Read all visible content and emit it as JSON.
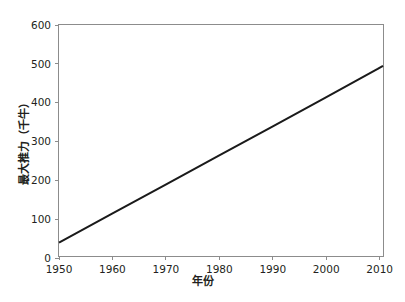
{
  "chart_data": {
    "type": "line",
    "title": "",
    "subtitle": "",
    "xlabel": "年份",
    "ylabel": "最大推力（千牛）",
    "xlim": [
      1950,
      2011
    ],
    "ylim": [
      0,
      600
    ],
    "xticks": [
      1950,
      1960,
      1970,
      1980,
      1990,
      2000,
      2010
    ],
    "xticklabels": [
      "1950",
      "1960",
      "1970",
      "1980",
      "1990",
      "2000",
      "2010"
    ],
    "yticks": [
      0,
      100,
      200,
      300,
      400,
      500,
      600
    ],
    "yticklabels": [
      "0",
      "100",
      "200",
      "300",
      "400",
      "500",
      "600"
    ],
    "grid": false,
    "legend": false,
    "legend_position": "none",
    "annotations": [],
    "series": [
      {
        "name": "最大推力",
        "color": "#1a1a1a",
        "linewidth": 2,
        "x": [
          1950,
          1960,
          1970,
          1980,
          1990,
          2000,
          2010,
          2011
        ],
        "values": [
          35,
          110,
          185,
          260,
          335,
          410,
          486,
          494
        ]
      }
    ]
  },
  "axes": {
    "y_tick_labels": [
      "600",
      "500",
      "400",
      "300",
      "200",
      "100",
      "0"
    ],
    "x_tick_labels": [
      "1950",
      "1960",
      "1970",
      "1980",
      "1990",
      "2000",
      "2010"
    ],
    "x_axis_title": "年份",
    "y_axis_title": "最大推力（千牛）"
  },
  "colors": {
    "background": "#ffffff",
    "line": "#1a1a1a",
    "axis": "#8c8c8c",
    "text": "#231f20"
  }
}
